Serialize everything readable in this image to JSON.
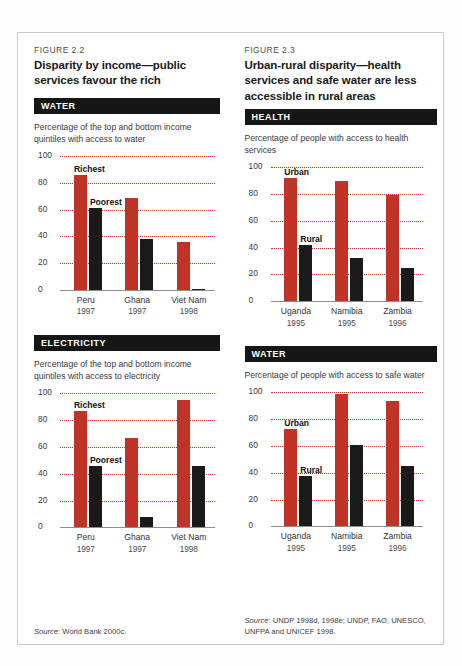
{
  "figures": [
    {
      "number": "FIGURE 2.2",
      "title": "Disparity by income—public services favour the rich",
      "source_prefix": "Source:",
      "source": "World Bank 2000c.",
      "sections": [
        {
          "band": "WATER",
          "subtitle": "Percentage of the top and bottom income quintiles with access to water",
          "label_a": "Richest",
          "label_b": "Poorest"
        },
        {
          "band": "ELECTRICITY",
          "subtitle": "Percentage of the top and bottom income quintiles with access to electricity",
          "label_a": "Richest",
          "label_b": "Poorest"
        }
      ]
    },
    {
      "number": "FIGURE 2.3",
      "title": "Urban-rural disparity—health services and safe water are less accessible in rural areas",
      "source_prefix": "Source:",
      "source": "UNDP 1998d, 1998e; UNDP, FAO, UNESCO, UNFPA and UNICEF 1998.",
      "sections": [
        {
          "band": "HEALTH",
          "subtitle": "Percentage of people with access to health services",
          "label_a": "Urban",
          "label_b": "Rural"
        },
        {
          "band": "WATER",
          "subtitle": "Percentage of people with access to safe water",
          "label_a": "Urban",
          "label_b": "Rural"
        }
      ]
    }
  ],
  "colors": {
    "bar_red": "#bf3427",
    "bar_black": "#1a1a1a",
    "gridline": "#c0392b",
    "band_bg": "#161616",
    "border": "#c9c9c9"
  },
  "chart_data": [
    {
      "type": "bar",
      "title": "WATER",
      "subtitle": "Percentage of the top and bottom income quintiles with access to water",
      "xlabel": "",
      "ylabel": "",
      "ylim": [
        0,
        100
      ],
      "yticks": [
        0,
        20,
        40,
        60,
        80,
        100
      ],
      "grid": true,
      "legend_position": "inline-annotation",
      "categories": [
        "Peru",
        "Ghana",
        "Viet Nam"
      ],
      "category_years": [
        "1997",
        "1997",
        "1998"
      ],
      "series": [
        {
          "name": "Richest",
          "color": "#bf3427",
          "values": [
            86,
            69,
            36
          ]
        },
        {
          "name": "Poorest",
          "color": "#1a1a1a",
          "values": [
            61,
            38,
            1
          ]
        }
      ]
    },
    {
      "type": "bar",
      "title": "ELECTRICITY",
      "subtitle": "Percentage of the top and bottom income quintiles with access to electricity",
      "xlabel": "",
      "ylabel": "",
      "ylim": [
        0,
        100
      ],
      "yticks": [
        0,
        20,
        40,
        60,
        80,
        100
      ],
      "grid": true,
      "legend_position": "inline-annotation",
      "categories": [
        "Peru",
        "Ghana",
        "Viet Nam"
      ],
      "category_years": [
        "1997",
        "1997",
        "1998"
      ],
      "series": [
        {
          "name": "Richest",
          "color": "#bf3427",
          "values": [
            87,
            67,
            95
          ]
        },
        {
          "name": "Poorest",
          "color": "#1a1a1a",
          "values": [
            46,
            8,
            46
          ]
        }
      ]
    },
    {
      "type": "bar",
      "title": "HEALTH",
      "subtitle": "Percentage of people with access to health services",
      "xlabel": "",
      "ylabel": "",
      "ylim": [
        0,
        100
      ],
      "yticks": [
        0,
        20,
        40,
        60,
        80,
        100
      ],
      "grid": true,
      "legend_position": "inline-annotation",
      "categories": [
        "Uganda",
        "Namibia",
        "Zambia"
      ],
      "category_years": [
        "1995",
        "1995",
        "1996"
      ],
      "series": [
        {
          "name": "Urban",
          "color": "#bf3427",
          "values": [
            92,
            90,
            79
          ]
        },
        {
          "name": "Rural",
          "color": "#1a1a1a",
          "values": [
            42,
            32,
            25
          ]
        }
      ]
    },
    {
      "type": "bar",
      "title": "WATER",
      "subtitle": "Percentage of people with access to safe water",
      "xlabel": "",
      "ylabel": "",
      "ylim": [
        0,
        100
      ],
      "yticks": [
        0,
        20,
        40,
        60,
        80,
        100
      ],
      "grid": true,
      "legend_position": "inline-annotation",
      "categories": [
        "Uganda",
        "Namibia",
        "Zambia"
      ],
      "category_years": [
        "1995",
        "1995",
        "1996"
      ],
      "series": [
        {
          "name": "Urban",
          "color": "#bf3427",
          "values": [
            73,
            99,
            94
          ]
        },
        {
          "name": "Rural",
          "color": "#1a1a1a",
          "values": [
            38,
            61,
            45
          ]
        }
      ]
    }
  ]
}
